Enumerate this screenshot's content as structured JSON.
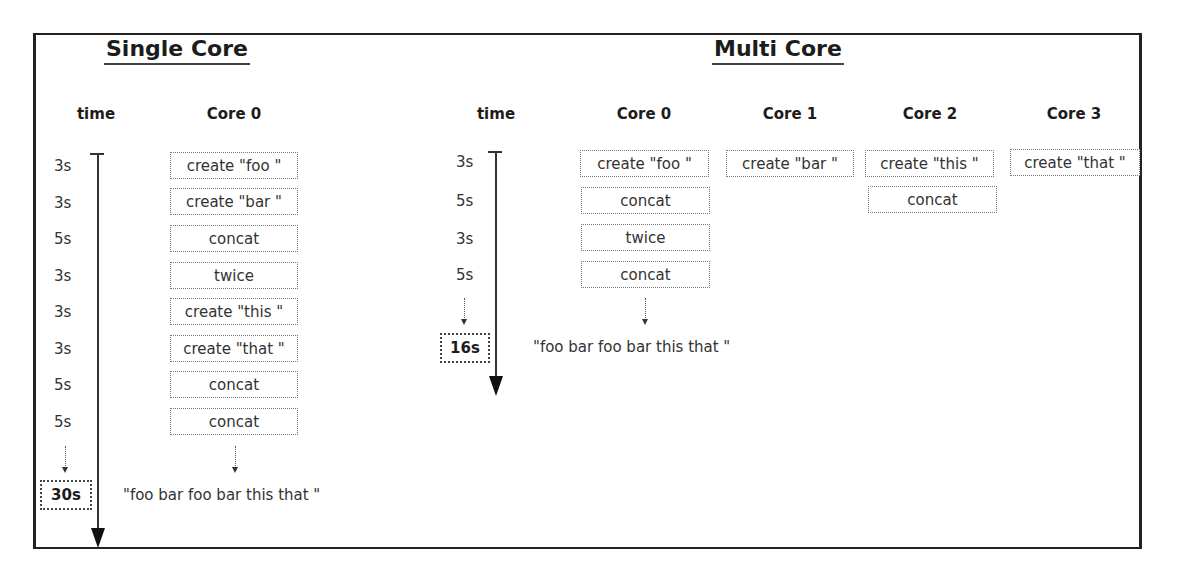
{
  "single_core": {
    "title": "Single Core",
    "time_header": "time",
    "core_headers": [
      "Core 0"
    ],
    "rows": [
      {
        "time": "3s",
        "task": "create \"foo \""
      },
      {
        "time": "3s",
        "task": "create \"bar \""
      },
      {
        "time": "5s",
        "task": "concat"
      },
      {
        "time": "3s",
        "task": "twice"
      },
      {
        "time": "3s",
        "task": "create \"this \""
      },
      {
        "time": "3s",
        "task": "create \"that \""
      },
      {
        "time": "5s",
        "task": "concat"
      },
      {
        "time": "5s",
        "task": "concat"
      }
    ],
    "total": "30s",
    "result": "\"foo bar foo bar this that \""
  },
  "multi_core": {
    "title": "Multi Core",
    "time_header": "time",
    "core_headers": [
      "Core 0",
      "Core 1",
      "Core 2",
      "Core 3"
    ],
    "times": [
      "3s",
      "5s",
      "3s",
      "5s"
    ],
    "cores": [
      [
        "create \"foo \"",
        "concat",
        "twice",
        "concat"
      ],
      [
        "create \"bar \""
      ],
      [
        "create \"this \"",
        "concat"
      ],
      [
        "create \"that \""
      ]
    ],
    "total": "16s",
    "result": "\"foo bar foo bar this that \""
  }
}
